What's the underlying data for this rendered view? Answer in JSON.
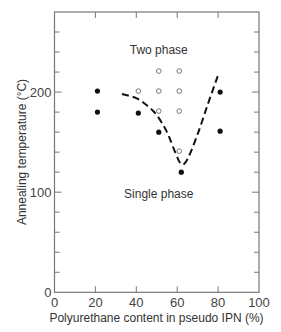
{
  "chart_data": {
    "type": "scatter",
    "title": "",
    "xlabel": "Polyurethane content in pseudo IPN (%)",
    "ylabel": "Annealing temperature (°C)",
    "xlim": [
      0,
      100
    ],
    "ylim": [
      0,
      280
    ],
    "x_ticks": [
      0,
      20,
      40,
      60,
      80,
      100
    ],
    "y_ticks_labeled": [
      0,
      100,
      200
    ],
    "y_minor_tick_step": 20,
    "grid": false,
    "annotations": [
      {
        "text": "Two phase",
        "x": 50,
        "y": 242
      },
      {
        "text": "Single phase",
        "x": 50,
        "y": 98
      }
    ],
    "series": [
      {
        "name": "Single phase (filled)",
        "marker": "filled-circle",
        "points": [
          [
            21,
            201
          ],
          [
            21,
            180
          ],
          [
            41,
            179
          ],
          [
            51,
            160
          ],
          [
            62,
            120
          ],
          [
            81,
            200
          ],
          [
            81,
            161
          ]
        ]
      },
      {
        "name": "Two phase (open)",
        "marker": "open-circle",
        "points": [
          [
            41,
            201
          ],
          [
            51,
            221
          ],
          [
            51,
            201
          ],
          [
            51,
            181
          ],
          [
            61,
            221
          ],
          [
            61,
            201
          ],
          [
            61,
            181
          ],
          [
            61,
            141
          ]
        ]
      },
      {
        "name": "Phase boundary (dashed)",
        "marker": "dashed-line",
        "points": [
          [
            33,
            198
          ],
          [
            40,
            194
          ],
          [
            45,
            187
          ],
          [
            50,
            177
          ],
          [
            55,
            160
          ],
          [
            59,
            140
          ],
          [
            62,
            128
          ],
          [
            65,
            133
          ],
          [
            70,
            158
          ],
          [
            75,
            188
          ],
          [
            80,
            217
          ]
        ]
      }
    ]
  }
}
